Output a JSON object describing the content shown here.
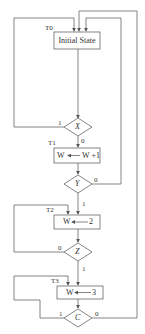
{
  "diagram": {
    "type": "flowchart",
    "states": [
      {
        "id": "T0",
        "label": "T0",
        "text": "Initial State"
      },
      {
        "id": "T1",
        "label": "T1",
        "text": "W ← W +1",
        "lhs": "W",
        "rhs": "W +1"
      },
      {
        "id": "T2",
        "label": "T2",
        "text": "W ← 2",
        "lhs": "W",
        "rhs": "2"
      },
      {
        "id": "T3",
        "label": "T3",
        "text": "W ← 3",
        "lhs": "W",
        "rhs": "3"
      }
    ],
    "decisions": [
      {
        "id": "X",
        "text": "X",
        "true_label": "1",
        "false_label": "0"
      },
      {
        "id": "Y",
        "text": "Y",
        "true_label": "1",
        "false_label": "0"
      },
      {
        "id": "Z",
        "text": "Z",
        "true_label": "1",
        "false_label": "0"
      },
      {
        "id": "C",
        "text": "C",
        "true_label": "1",
        "false_label": "0"
      }
    ],
    "edges": [
      {
        "from": "T0",
        "to": "X"
      },
      {
        "from": "X",
        "label": "1",
        "to": "T0"
      },
      {
        "from": "X",
        "label": "0",
        "to": "T1"
      },
      {
        "from": "T1",
        "to": "Y"
      },
      {
        "from": "Y",
        "label": "0",
        "to": "T0"
      },
      {
        "from": "Y",
        "label": "1",
        "to": "T2"
      },
      {
        "from": "T2",
        "to": "Z"
      },
      {
        "from": "Z",
        "label": "0",
        "to": "T2"
      },
      {
        "from": "Z",
        "label": "1",
        "to": "T3"
      },
      {
        "from": "T3",
        "to": "C"
      },
      {
        "from": "C",
        "label": "1",
        "to": "T3"
      },
      {
        "from": "C",
        "label": "0",
        "to": "T0"
      }
    ],
    "colors": {
      "line": "#555555",
      "text": "#333333",
      "background": "#ffffff"
    }
  }
}
